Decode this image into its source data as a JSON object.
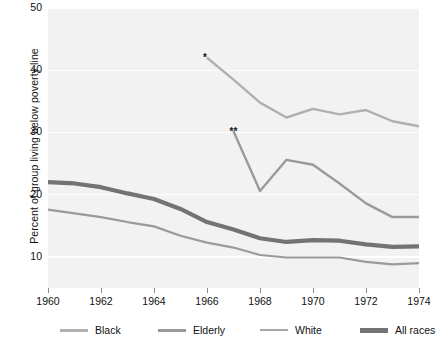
{
  "chart_data": {
    "type": "line",
    "title": "",
    "xlabel": "",
    "ylabel": "Percent of group living below poverty line",
    "xlim": [
      1960,
      1974
    ],
    "ylim": [
      5,
      50
    ],
    "grid": true,
    "legend_position": "bottom",
    "x_ticks": [
      "1960",
      "1962",
      "1964",
      "1966",
      "1968",
      "1970",
      "1972",
      "1974"
    ],
    "x_tick_values": [
      1960,
      1962,
      1964,
      1966,
      1968,
      1970,
      1972,
      1974
    ],
    "y_ticks": [
      "10",
      "20",
      "30",
      "40",
      "50"
    ],
    "y_tick_values": [
      10,
      20,
      30,
      40,
      50
    ],
    "series": [
      {
        "name": "Black",
        "color": "#b0b0b0",
        "width": 2.4,
        "x": [
          1966,
          1967,
          1968,
          1969,
          1970,
          1971,
          1972,
          1973,
          1974
        ],
        "values": [
          42.0,
          38.5,
          34.8,
          32.4,
          33.8,
          32.9,
          33.6,
          31.8,
          31.0
        ]
      },
      {
        "name": "Elderly",
        "color": "#9a9a9a",
        "width": 2.4,
        "x": [
          1967,
          1968,
          1969,
          1970,
          1971,
          1972,
          1973,
          1974
        ],
        "values": [
          30.2,
          20.6,
          25.6,
          24.8,
          21.8,
          18.6,
          16.4,
          16.4
        ]
      },
      {
        "name": "White",
        "color": "#9a9a9a",
        "width": 2.2,
        "x": [
          1960,
          1961,
          1962,
          1963,
          1964,
          1965,
          1966,
          1967,
          1968,
          1969,
          1970,
          1971,
          1972,
          1973,
          1974
        ],
        "values": [
          17.6,
          17.0,
          16.4,
          15.6,
          14.9,
          13.4,
          12.3,
          11.5,
          10.3,
          9.9,
          9.9,
          9.9,
          9.2,
          8.8,
          9.0
        ]
      },
      {
        "name": "All races",
        "color": "#737373",
        "width": 4.2,
        "x": [
          1960,
          1961,
          1962,
          1963,
          1964,
          1965,
          1966,
          1967,
          1968,
          1969,
          1970,
          1971,
          1972,
          1973,
          1974
        ],
        "values": [
          22.0,
          21.8,
          21.2,
          20.2,
          19.3,
          17.7,
          15.6,
          14.4,
          13.0,
          12.4,
          12.7,
          12.6,
          12.0,
          11.6,
          11.7
        ]
      }
    ],
    "annotations": [
      {
        "text": "*",
        "x": 1965.85,
        "y": 42.7
      },
      {
        "text": "**",
        "x": 1966.85,
        "y": 30.9
      }
    ]
  },
  "legend": {
    "items": [
      {
        "label": "Black",
        "color": "#b0b0b0",
        "thickness": 3
      },
      {
        "label": "Elderly",
        "color": "#9a9a9a",
        "thickness": 3
      },
      {
        "label": "White",
        "color": "#a8a8a8",
        "thickness": 2
      },
      {
        "label": "All races",
        "color": "#737373",
        "thickness": 5
      }
    ]
  },
  "colors": {
    "plot_background": "#f2f2f2",
    "gridline": "#ffffff",
    "page_background": "#ffffff",
    "text": "#111111"
  }
}
